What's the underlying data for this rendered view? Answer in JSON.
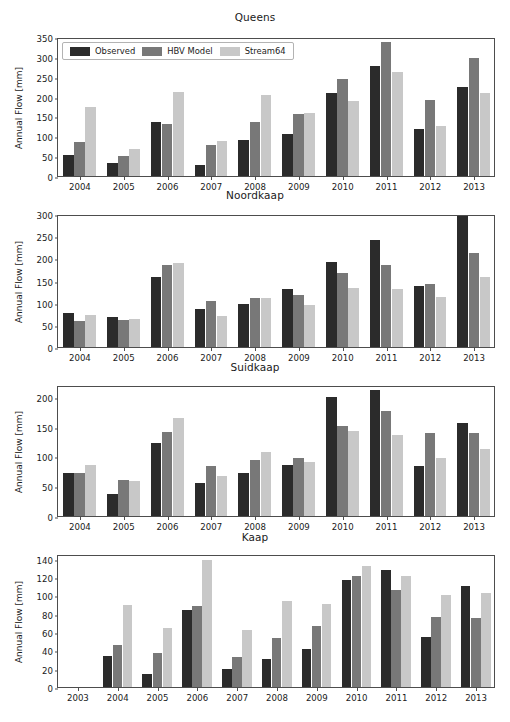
{
  "figure": {
    "ylabel": "Annual Flow [mm]",
    "series_colors": {
      "Observed": "#2b2b2b",
      "HBV Model": "#787878",
      "Stream64": "#c8c8c8"
    }
  },
  "legend": {
    "entries": [
      {
        "label": "Observed",
        "color": "#2b2b2b",
        "swatch_name": "legend-swatch-observed"
      },
      {
        "label": "HBV Model",
        "color": "#787878",
        "swatch_name": "legend-swatch-hbv-model"
      },
      {
        "label": "Stream64",
        "color": "#c8c8c8",
        "swatch_name": "legend-swatch-stream64"
      }
    ]
  },
  "chart_data": [
    {
      "type": "bar",
      "title": "Queens",
      "xlabel": "",
      "ylabel": "Annual Flow [mm]",
      "categories": [
        "2004",
        "2005",
        "2006",
        "2007",
        "2008",
        "2009",
        "2010",
        "2011",
        "2012",
        "2013"
      ],
      "xticks": [
        "2004",
        "2005",
        "2006",
        "2007",
        "2008",
        "2009",
        "2010",
        "2011",
        "2012",
        "2013"
      ],
      "yticks": [
        0,
        50,
        100,
        150,
        200,
        250,
        300,
        350
      ],
      "ylim": [
        0,
        350
      ],
      "grid": false,
      "legend_position": "upper left",
      "series": [
        {
          "name": "Observed",
          "color": "#2b2b2b",
          "values": [
            54,
            32,
            136,
            27,
            90,
            105,
            210,
            276,
            118,
            225
          ]
        },
        {
          "name": "HBV Model",
          "color": "#787878",
          "values": [
            85,
            51,
            131,
            77,
            135,
            156,
            244,
            338,
            191,
            296
          ]
        },
        {
          "name": "Stream64",
          "color": "#c8c8c8",
          "values": [
            173,
            68,
            212,
            88,
            203,
            158,
            190,
            261,
            125,
            209
          ]
        }
      ]
    },
    {
      "type": "bar",
      "title": "Noordkaap",
      "xlabel": "",
      "ylabel": "Annual Flow [mm]",
      "categories": [
        "2004",
        "2005",
        "2006",
        "2007",
        "2008",
        "2009",
        "2010",
        "2011",
        "2012",
        "2013"
      ],
      "xticks": [
        "2004",
        "2005",
        "2006",
        "2007",
        "2008",
        "2009",
        "2010",
        "2011",
        "2012",
        "2013"
      ],
      "yticks": [
        0,
        50,
        100,
        150,
        200,
        250,
        300
      ],
      "ylim": [
        0,
        300
      ],
      "grid": false,
      "legend_position": "none",
      "series": [
        {
          "name": "Observed",
          "color": "#2b2b2b",
          "values": [
            76,
            67,
            158,
            86,
            97,
            130,
            192,
            242,
            137,
            296
          ]
        },
        {
          "name": "HBV Model",
          "color": "#787878",
          "values": [
            59,
            61,
            184,
            104,
            111,
            117,
            166,
            186,
            142,
            212
          ]
        },
        {
          "name": "Stream64",
          "color": "#c8c8c8",
          "values": [
            72,
            63,
            190,
            69,
            110,
            95,
            132,
            130,
            112,
            157
          ]
        }
      ]
    },
    {
      "type": "bar",
      "title": "Suidkaap",
      "xlabel": "",
      "ylabel": "Annual Flow [mm]",
      "categories": [
        "2004",
        "2005",
        "2006",
        "2007",
        "2008",
        "2009",
        "2010",
        "2011",
        "2012",
        "2013"
      ],
      "xticks": [
        "2004",
        "2005",
        "2006",
        "2007",
        "2008",
        "2009",
        "2010",
        "2011",
        "2012",
        "2013"
      ],
      "yticks": [
        0,
        50,
        100,
        150,
        200
      ],
      "ylim": [
        0,
        220
      ],
      "grid": false,
      "legend_position": "none",
      "series": [
        {
          "name": "Observed",
          "color": "#2b2b2b",
          "values": [
            72,
            37,
            122,
            56,
            72,
            86,
            200,
            212,
            84,
            157
          ]
        },
        {
          "name": "HBV Model",
          "color": "#787878",
          "values": [
            72,
            61,
            141,
            84,
            94,
            98,
            152,
            176,
            139,
            140
          ]
        },
        {
          "name": "Stream64",
          "color": "#c8c8c8",
          "values": [
            85,
            59,
            165,
            68,
            108,
            90,
            142,
            136,
            98,
            113
          ]
        }
      ]
    },
    {
      "type": "bar",
      "title": "Kaap",
      "xlabel": "",
      "ylabel": "Annual Flow [mm]",
      "categories": [
        "2004",
        "2005",
        "2006",
        "2007",
        "2008",
        "2009",
        "2010",
        "2011",
        "2012",
        "2013"
      ],
      "xticks": [
        "2003",
        "2004",
        "2005",
        "2006",
        "2007",
        "2008",
        "2009",
        "2010",
        "2011",
        "2012",
        "2013"
      ],
      "yticks": [
        0,
        20,
        40,
        60,
        80,
        100,
        120,
        140
      ],
      "ylim": [
        0,
        145
      ],
      "grid": false,
      "legend_position": "none",
      "series": [
        {
          "name": "Observed",
          "color": "#2b2b2b",
          "values": [
            34,
            14,
            84,
            20,
            30,
            41,
            117,
            128,
            54,
            110
          ]
        },
        {
          "name": "HBV Model",
          "color": "#787878",
          "values": [
            46,
            37,
            88,
            33,
            53,
            66,
            121,
            106,
            76,
            75
          ]
        },
        {
          "name": "Stream64",
          "color": "#c8c8c8",
          "values": [
            89,
            64,
            139,
            62,
            94,
            91,
            132,
            121,
            100,
            102
          ]
        }
      ]
    }
  ]
}
